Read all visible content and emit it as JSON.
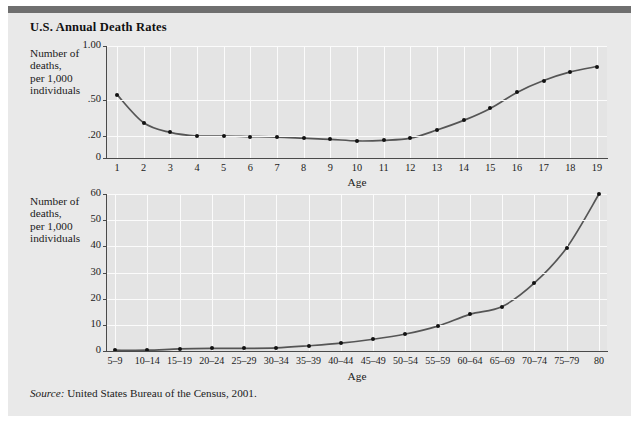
{
  "figure": {
    "title": "U.S. Annual Death Rates",
    "source_label": "Source:",
    "source_text": " United States Bureau of the Census, 2001.",
    "accent_bar_color": "#6f6f6f",
    "panel_color": "#e9e9e9",
    "plot_color": "#e4e4e4",
    "line_color": "#555555",
    "marker_color": "#121212",
    "grid_color": "#fbfbfb"
  },
  "chart_data": [
    {
      "type": "line",
      "title": "U.S. Annual Death Rates",
      "id": "top-chart",
      "ylabel": "Number of\ndeaths,\nper 1,000\nindividuals",
      "xlabel": "Age",
      "grid": true,
      "legend": "none",
      "categories": [
        "1",
        "2",
        "3",
        "4",
        "5",
        "6",
        "7",
        "8",
        "9",
        "10",
        "11",
        "12",
        "13",
        "14",
        "15",
        "16",
        "17",
        "18",
        "19"
      ],
      "values": [
        0.55,
        0.31,
        0.23,
        0.2,
        0.2,
        0.195,
        0.19,
        0.18,
        0.17,
        0.155,
        0.16,
        0.18,
        0.25,
        0.33,
        0.43,
        0.57,
        0.68,
        0.76,
        0.81
      ],
      "ytick_labels": [
        "1.00",
        ".50",
        ".20",
        "0"
      ],
      "ytick_values": [
        1.0,
        0.5,
        0.2,
        0
      ],
      "ytick_positions_px": [
        0,
        54,
        90,
        112
      ],
      "ylim": [
        0,
        1.0
      ],
      "axis_note": "non-linear vertical spacing: gridline rows drawn at 1.00, .50, .20, 0"
    },
    {
      "type": "line",
      "id": "bottom-chart",
      "ylabel": "Number of\ndeaths,\nper 1,000\nindividuals",
      "xlabel": "Age",
      "grid": true,
      "legend": "none",
      "categories": [
        "5–9",
        "10–14",
        "15–19",
        "20–24",
        "25–29",
        "30–34",
        "35–39",
        "40–44",
        "45–49",
        "50–54",
        "55–59",
        "60–64",
        "65–69",
        "70–74",
        "75–79",
        "80"
      ],
      "values": [
        0.3,
        0.3,
        0.8,
        1.0,
        1.0,
        1.2,
        2.0,
        3.0,
        4.5,
        6.5,
        9.5,
        14.0,
        17.0,
        26.0,
        39.5,
        60.0
      ],
      "ytick_labels": [
        "60",
        "50",
        "40",
        "30",
        "20",
        "10",
        "0"
      ],
      "ytick_values": [
        60,
        50,
        40,
        30,
        20,
        10,
        0
      ],
      "ylim": [
        0,
        60
      ]
    }
  ]
}
